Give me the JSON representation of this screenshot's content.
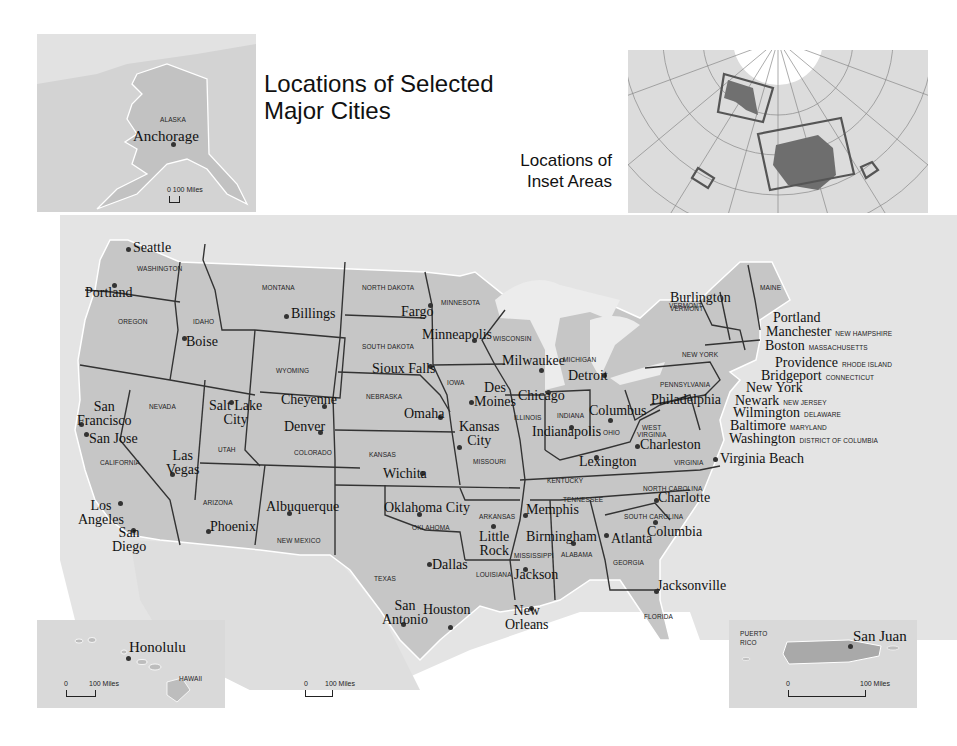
{
  "title": "Locations of Selected Major Cities",
  "title_lines": [
    "Locations of Selected",
    "Major Cities"
  ],
  "inset_locator": {
    "title_lines": [
      "Locations of",
      "Inset Areas"
    ]
  },
  "colors": {
    "land": "#c8c8c8",
    "water": "#e6e6e6",
    "inset_bg": "#d9d9d9",
    "border": "#333333",
    "text": "#111111"
  },
  "insets": {
    "alaska": {
      "state": "ALASKA",
      "city": "Anchorage",
      "scale": "0 100 Miles"
    },
    "hawaii": {
      "state": "HAWAII",
      "city": "Honolulu",
      "scale_zero": "0",
      "scale_label": "100  Miles"
    },
    "puerto_rico": {
      "state_lines": [
        "PUERTO",
        "RICO"
      ],
      "city": "San Juan",
      "scale_zero": "0",
      "scale_label": "100  Miles"
    }
  },
  "main_scale": {
    "zero": "0",
    "label": "100  Miles"
  },
  "states": [
    {
      "name": "WASHINGTON",
      "x": 137,
      "y": 265
    },
    {
      "name": "OREGON",
      "x": 118,
      "y": 318
    },
    {
      "name": "IDAHO",
      "x": 193,
      "y": 318
    },
    {
      "name": "MONTANA",
      "x": 262,
      "y": 284
    },
    {
      "name": "WYOMING",
      "x": 276,
      "y": 367
    },
    {
      "name": "NEVADA",
      "x": 149,
      "y": 403
    },
    {
      "name": "CALIFORNIA",
      "x": 100,
      "y": 459
    },
    {
      "name": "UTAH",
      "x": 218,
      "y": 446
    },
    {
      "name": "COLORADO",
      "x": 294,
      "y": 449
    },
    {
      "name": "ARIZONA",
      "x": 203,
      "y": 499
    },
    {
      "name": "NEW MEXICO",
      "x": 277,
      "y": 537
    },
    {
      "name": "NORTH DAKOTA",
      "x": 362,
      "y": 284
    },
    {
      "name": "SOUTH DAKOTA",
      "x": 362,
      "y": 343
    },
    {
      "name": "NEBRASKA",
      "x": 366,
      "y": 393
    },
    {
      "name": "KANSAS",
      "x": 369,
      "y": 451
    },
    {
      "name": "OKLAHOMA",
      "x": 412,
      "y": 524
    },
    {
      "name": "TEXAS",
      "x": 374,
      "y": 575
    },
    {
      "name": "MINNESOTA",
      "x": 441,
      "y": 299
    },
    {
      "name": "IOWA",
      "x": 447,
      "y": 379
    },
    {
      "name": "MISSOURI",
      "x": 473,
      "y": 458
    },
    {
      "name": "ARKANSAS",
      "x": 479,
      "y": 513
    },
    {
      "name": "LOUISIANA",
      "x": 476,
      "y": 571
    },
    {
      "name": "WISCONSIN",
      "x": 493,
      "y": 335
    },
    {
      "name": "ILLINOIS",
      "x": 514,
      "y": 414
    },
    {
      "name": "MICHIGAN",
      "x": 563,
      "y": 356
    },
    {
      "name": "INDIANA",
      "x": 557,
      "y": 412
    },
    {
      "name": "OHIO",
      "x": 603,
      "y": 429
    },
    {
      "name": "KENTUCKY",
      "x": 547,
      "y": 477
    },
    {
      "name": "TENNESSEE",
      "x": 563,
      "y": 496
    },
    {
      "name": "MISSISSIPPI",
      "x": 514,
      "y": 552
    },
    {
      "name": "ALABAMA",
      "x": 561,
      "y": 551
    },
    {
      "name": "GEORGIA",
      "x": 613,
      "y": 559
    },
    {
      "name": "FLORIDA",
      "x": 644,
      "y": 613
    },
    {
      "name": "SOUTH CAROLINA",
      "x": 624,
      "y": 513
    },
    {
      "name": "NORTH CAROLINA",
      "x": 643,
      "y": 485
    },
    {
      "name": "VIRGINIA",
      "x": 674,
      "y": 459
    },
    {
      "name": "WEST VIRGINIA",
      "x": 637,
      "y": 424,
      "lines": [
        "WEST",
        "VIRGINIA"
      ]
    },
    {
      "name": "PENNSYLVANIA",
      "x": 660,
      "y": 381
    },
    {
      "name": "NEW YORK",
      "x": 682,
      "y": 351
    },
    {
      "name": "MAINE",
      "x": 760,
      "y": 284
    },
    {
      "name": "VERMONT",
      "x": 669,
      "y": 302
    }
  ],
  "cities": [
    {
      "name": "Seattle",
      "dx": 128,
      "dy": 249,
      "lx": 133,
      "ly": 241
    },
    {
      "name": "Portland",
      "dx": 114,
      "dy": 285,
      "lx": 85,
      "ly": 286
    },
    {
      "name": "Boise",
      "dx": 184,
      "dy": 338,
      "lx": 186,
      "ly": 335
    },
    {
      "name": "Billings",
      "dx": 286,
      "dy": 316,
      "lx": 291,
      "ly": 307
    },
    {
      "name": "Fargo",
      "dx": 430,
      "dy": 305,
      "lx": 401,
      "ly": 305
    },
    {
      "name": "Minneapolis",
      "dx": 474,
      "dy": 340,
      "lx": 422,
      "ly": 328
    },
    {
      "name": "Milwaukee",
      "dx": 541,
      "dy": 370,
      "lx": 502,
      "ly": 354
    },
    {
      "name": "Detroit",
      "dx": 604,
      "dy": 375,
      "lx": 568,
      "ly": 369
    },
    {
      "name": "Sioux Falls",
      "dx": 430,
      "dy": 366,
      "lx": 372,
      "ly": 362
    },
    {
      "name": "Des Moines",
      "dx": 471,
      "dy": 402,
      "lx": 474,
      "ly": 381,
      "lines": [
        "Des",
        "Moines"
      ]
    },
    {
      "name": "Chicago",
      "dx": 548,
      "dy": 392,
      "lx": 518,
      "ly": 389
    },
    {
      "name": "Cheyenne",
      "dx": 324,
      "dy": 406,
      "lx": 281,
      "ly": 393
    },
    {
      "name": "Salt Lake City",
      "dx": 231,
      "dy": 402,
      "lx": 209,
      "ly": 399,
      "lines": [
        "Salt Lake",
        "City"
      ]
    },
    {
      "name": "San Francisco",
      "dx": 81,
      "dy": 424,
      "lx": 77,
      "ly": 400,
      "lines": [
        "San",
        "Francisco"
      ]
    },
    {
      "name": "San Jose",
      "dx": 86,
      "dy": 434,
      "lx": 89,
      "ly": 432
    },
    {
      "name": "Omaha",
      "dx": 440,
      "dy": 417,
      "lx": 404,
      "ly": 407
    },
    {
      "name": "Kansas City",
      "dx": 459,
      "dy": 447,
      "lx": 459,
      "ly": 420,
      "lines": [
        "Kansas",
        "City"
      ]
    },
    {
      "name": "Denver",
      "dx": 320,
      "dy": 432,
      "lx": 284,
      "ly": 420
    },
    {
      "name": "Indianapolis",
      "dx": 571,
      "dy": 427,
      "lx": 532,
      "ly": 425
    },
    {
      "name": "Columbus",
      "dx": 610,
      "dy": 420,
      "lx": 589,
      "ly": 404
    },
    {
      "name": "Charleston",
      "dx": 637,
      "dy": 446,
      "lx": 640,
      "ly": 438
    },
    {
      "name": "Lexington",
      "dx": 596,
      "dy": 457,
      "lx": 579,
      "ly": 455
    },
    {
      "name": "Las Vegas",
      "dx": 172,
      "dy": 474,
      "lx": 166,
      "ly": 449,
      "lines": [
        "Las",
        "Vegas"
      ]
    },
    {
      "name": "Wichita",
      "dx": 422,
      "dy": 473,
      "lx": 383,
      "ly": 467
    },
    {
      "name": "Los Angeles",
      "dx": 120,
      "dy": 503,
      "lx": 78,
      "ly": 499,
      "lines": [
        "Los",
        "Angeles"
      ]
    },
    {
      "name": "San Diego",
      "dx": 133,
      "dy": 530,
      "lx": 112,
      "ly": 526,
      "lines": [
        "San",
        "Diego"
      ]
    },
    {
      "name": "Phoenix",
      "dx": 208,
      "dy": 531,
      "lx": 210,
      "ly": 520
    },
    {
      "name": "Albuquerque",
      "dx": 289,
      "dy": 513,
      "lx": 266,
      "ly": 500
    },
    {
      "name": "Oklahoma City",
      "dx": 419,
      "dy": 514,
      "lx": 384,
      "ly": 501
    },
    {
      "name": "Memphis",
      "dx": 525,
      "dy": 515,
      "lx": 526,
      "ly": 503
    },
    {
      "name": "Little Rock",
      "dx": 493,
      "dy": 526,
      "lx": 479,
      "ly": 530,
      "lines": [
        "Little",
        "Rock"
      ]
    },
    {
      "name": "Birmingham",
      "dx": 573,
      "dy": 543,
      "lx": 526,
      "ly": 530
    },
    {
      "name": "Atlanta",
      "dx": 606,
      "dy": 535,
      "lx": 611,
      "ly": 532
    },
    {
      "name": "Charlotte",
      "dx": 656,
      "dy": 500,
      "lx": 658,
      "ly": 491
    },
    {
      "name": "Columbia",
      "dx": 655,
      "dy": 522,
      "lx": 647,
      "ly": 525
    },
    {
      "name": "Virginia Beach",
      "dx": 715,
      "dy": 459,
      "lx": 720,
      "ly": 452
    },
    {
      "name": "Dallas",
      "dx": 429,
      "dy": 564,
      "lx": 432,
      "ly": 558
    },
    {
      "name": "Jackson",
      "dx": 525,
      "dy": 569,
      "lx": 514,
      "ly": 568
    },
    {
      "name": "Jacksonville",
      "dx": 656,
      "dy": 591,
      "lx": 657,
      "ly": 579
    },
    {
      "name": "San Antonio",
      "dx": 403,
      "dy": 624,
      "lx": 382,
      "ly": 599,
      "lines": [
        "San",
        "Antonio"
      ]
    },
    {
      "name": "Houston",
      "dx": 450,
      "dy": 627,
      "lx": 423,
      "ly": 603
    },
    {
      "name": "New Orleans",
      "dx": 531,
      "dy": 608,
      "lx": 505,
      "ly": 604,
      "lines": [
        "New",
        "Orleans"
      ]
    }
  ],
  "northeast_callouts": [
    {
      "name": "Burlington",
      "state": "VERMONT",
      "lx": 670,
      "ly": 291
    },
    {
      "name": "Portland",
      "state": "",
      "lx": 773,
      "ly": 308
    },
    {
      "name": "Manchester",
      "state": "NEW HAMPSHIRE",
      "lx": 766,
      "ly": 322
    },
    {
      "name": "Boston",
      "state": "MASSACHUSETTS",
      "lx": 765,
      "ly": 336
    },
    {
      "name": "Providence",
      "state": "RHODE ISLAND",
      "lx": 775,
      "ly": 353
    },
    {
      "name": "Bridgeport",
      "state": "CONNECTICUT",
      "lx": 761,
      "ly": 366
    },
    {
      "name": "New York",
      "state": "",
      "lx": 746,
      "ly": 378
    },
    {
      "name": "Newark",
      "state": "NEW JERSEY",
      "lx": 735,
      "ly": 391
    },
    {
      "name": "Philadelphia",
      "state": "",
      "lx": 651,
      "ly": 390
    },
    {
      "name": "Wilmington",
      "state": "DELAWARE",
      "lx": 733,
      "ly": 403
    },
    {
      "name": "Baltimore",
      "state": "MARYLAND",
      "lx": 730,
      "ly": 416
    },
    {
      "name": "Washington",
      "state": "DISTRICT OF COLUMBIA",
      "lx": 729,
      "ly": 429
    }
  ]
}
